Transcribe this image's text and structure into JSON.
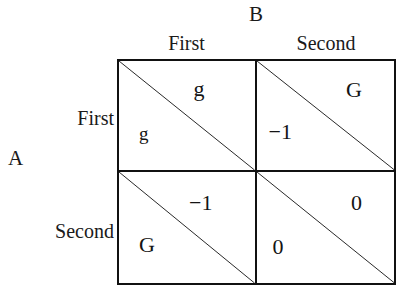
{
  "figure": {
    "type": "payoff-matrix",
    "row_player": "A",
    "col_player": "B",
    "row_strategies": [
      "First",
      "Second"
    ],
    "col_strategies": [
      "First",
      "Second"
    ],
    "cells": [
      {
        "row": "First",
        "col": "First",
        "col_player_payoff": "g",
        "row_player_payoff": "g"
      },
      {
        "row": "First",
        "col": "Second",
        "col_player_payoff": "G",
        "row_player_payoff": "−1"
      },
      {
        "row": "Second",
        "col": "First",
        "col_player_payoff": "−1",
        "row_player_payoff": "G"
      },
      {
        "row": "Second",
        "col": "Second",
        "col_player_payoff": "0",
        "row_player_payoff": "0"
      }
    ],
    "colors": {
      "line": "#111111",
      "text": "#141414",
      "background": "#ffffff"
    }
  }
}
